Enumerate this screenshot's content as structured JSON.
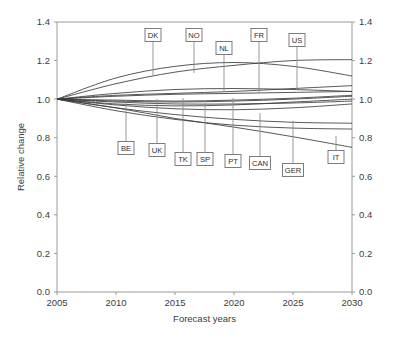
{
  "chart_data": {
    "type": "line",
    "title": "",
    "xlabel": "Forecast years",
    "ylabel": "Relative change",
    "xlim": [
      2005,
      2030
    ],
    "ylim": [
      0.0,
      1.4
    ],
    "xticks": [
      "2005",
      "2010",
      "2015",
      "2020",
      "2025",
      "2030"
    ],
    "xtick_values": [
      2005,
      2010,
      2015,
      2020,
      2025,
      2030
    ],
    "yticks": [
      "0.0",
      "0.2",
      "0.4",
      "0.6",
      "0.8",
      "1.0",
      "1.2",
      "1.4"
    ],
    "ytick_values": [
      0.0,
      0.2,
      0.4,
      0.6,
      0.8,
      1.0,
      1.2,
      1.4
    ],
    "yticks_right": [
      "0.0",
      "0.2",
      "0.4",
      "0.6",
      "0.8",
      "1.0",
      "1.2",
      "1.4"
    ],
    "grid": false,
    "legend_position": "none",
    "annotation_style": "boxed-country-code-with-leader-line",
    "x": [
      2005,
      2010,
      2015,
      2020,
      2025,
      2030
    ],
    "series": [
      {
        "name": "DK",
        "label": "DK",
        "values": [
          1.0,
          1.11,
          1.17,
          1.19,
          1.17,
          1.12
        ]
      },
      {
        "name": "NO",
        "label": "NO",
        "values": [
          1.0,
          1.08,
          1.14,
          1.175,
          1.2,
          1.205
        ]
      },
      {
        "name": "NL",
        "label": "NL",
        "values": [
          1.0,
          1.03,
          1.05,
          1.055,
          1.05,
          1.04
        ]
      },
      {
        "name": "FR",
        "label": "FR",
        "values": [
          1.0,
          1.015,
          1.025,
          1.03,
          1.035,
          1.04
        ]
      },
      {
        "name": "US",
        "label": "US",
        "values": [
          1.0,
          1.02,
          1.03,
          1.04,
          1.055,
          1.07
        ]
      },
      {
        "name": "BE",
        "label": "BE",
        "values": [
          1.0,
          0.975,
          0.965,
          0.97,
          0.985,
          1.0
        ]
      },
      {
        "name": "UK",
        "label": "UK",
        "values": [
          1.0,
          0.99,
          0.985,
          0.99,
          1.0,
          1.015
        ]
      },
      {
        "name": "TK",
        "label": "TK",
        "values": [
          1.0,
          0.985,
          0.975,
          0.975,
          0.98,
          0.99
        ]
      },
      {
        "name": "SP",
        "label": "SP",
        "values": [
          1.0,
          0.97,
          0.95,
          0.945,
          0.955,
          0.975
        ]
      },
      {
        "name": "PT",
        "label": "PT",
        "values": [
          1.0,
          0.995,
          0.99,
          0.995,
          1.005,
          1.02
        ]
      },
      {
        "name": "CAN",
        "label": "CAN",
        "values": [
          1.0,
          0.955,
          0.92,
          0.895,
          0.88,
          0.875
        ]
      },
      {
        "name": "GER",
        "label": "GER",
        "values": [
          1.0,
          0.94,
          0.895,
          0.865,
          0.85,
          0.845
        ]
      },
      {
        "name": "IT",
        "label": "IT",
        "values": [
          1.0,
          0.955,
          0.9,
          0.855,
          0.805,
          0.75
        ]
      }
    ],
    "annotations": [
      {
        "label": "DK",
        "box_x": 153,
        "box_y": 35,
        "anchor_x": 153,
        "anchor_y": 76,
        "placement": "top"
      },
      {
        "label": "NO",
        "box_x": 194,
        "box_y": 35,
        "anchor_x": 194,
        "anchor_y": 73,
        "placement": "top"
      },
      {
        "label": "NL",
        "box_x": 224,
        "box_y": 48,
        "anchor_x": 224,
        "anchor_y": 92,
        "placement": "top"
      },
      {
        "label": "FR",
        "box_x": 259,
        "box_y": 35,
        "anchor_x": 259,
        "anchor_y": 93,
        "placement": "top"
      },
      {
        "label": "US",
        "box_x": 297,
        "box_y": 40,
        "anchor_x": 297,
        "anchor_y": 88,
        "placement": "top"
      },
      {
        "label": "BE",
        "box_x": 126,
        "box_y": 148,
        "anchor_x": 126,
        "anchor_y": 100,
        "placement": "bottom"
      },
      {
        "label": "UK",
        "box_x": 157,
        "box_y": 150,
        "anchor_x": 157,
        "anchor_y": 99,
        "placement": "bottom"
      },
      {
        "label": "TK",
        "box_x": 183,
        "box_y": 159,
        "anchor_x": 183,
        "anchor_y": 98,
        "placement": "bottom"
      },
      {
        "label": "SP",
        "box_x": 205,
        "box_y": 159,
        "anchor_x": 205,
        "anchor_y": 103,
        "placement": "bottom"
      },
      {
        "label": "PT",
        "box_x": 233,
        "box_y": 161,
        "anchor_x": 233,
        "anchor_y": 98,
        "placement": "bottom"
      },
      {
        "label": "CAN",
        "box_x": 260,
        "box_y": 163,
        "anchor_x": 260,
        "anchor_y": 113,
        "placement": "bottom"
      },
      {
        "label": "GER",
        "box_x": 293,
        "box_y": 170,
        "anchor_x": 293,
        "anchor_y": 121,
        "placement": "bottom"
      },
      {
        "label": "IT",
        "box_x": 336,
        "box_y": 157,
        "anchor_x": 336,
        "anchor_y": 136,
        "placement": "bottom"
      }
    ],
    "colors": {
      "line": "#3a3a3a",
      "axis": "#9a9a9a",
      "text": "#3c3c3c",
      "background": "#ffffff"
    }
  }
}
